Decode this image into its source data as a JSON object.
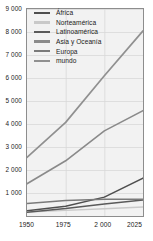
{
  "chart_data": {
    "type": "line",
    "title": "",
    "xlabel": "",
    "ylabel": "",
    "xlim": [
      1950,
      2025
    ],
    "ylim": [
      0,
      9000
    ],
    "grid": true,
    "legend_position": "top-left",
    "x": [
      1950,
      1975,
      2000,
      2025
    ],
    "y_ticks": [
      "1 000",
      "2 000",
      "3 000",
      "4 000",
      "5 000",
      "6 000",
      "7 000",
      "8 000",
      "9 000"
    ],
    "y_tick_values": [
      1000,
      2000,
      3000,
      4000,
      5000,
      6000,
      7000,
      8000,
      9000
    ],
    "x_ticks": [
      "1950",
      "1975",
      "2 000",
      "2025"
    ],
    "x_tick_values": [
      1950,
      1975,
      2000,
      2025
    ],
    "series": [
      {
        "name": "África",
        "color": "#4f4f4f",
        "width": 1.5,
        "values": [
          230,
          420,
          820,
          1650
        ]
      },
      {
        "name": "Norteamérica",
        "color": "#c9c9c9",
        "width": 1.4,
        "values": [
          172,
          243,
          316,
          390
        ]
      },
      {
        "name": "Latinoamérica",
        "color": "#5a5a5a",
        "width": 1.5,
        "values": [
          167,
          322,
          520,
          700
        ]
      },
      {
        "name": "Asia y Oceanía",
        "color": "#8a8a8a",
        "width": 1.6,
        "values": [
          1400,
          2400,
          3700,
          4580
        ]
      },
      {
        "name": "Europa",
        "color": "#7a7a7a",
        "width": 1.5,
        "values": [
          547,
          676,
          727,
          730
        ]
      },
      {
        "name": "mundo",
        "color": "#909090",
        "width": 1.7,
        "values": [
          2550,
          4070,
          6100,
          8050
        ]
      }
    ]
  },
  "legend": {
    "items": [
      {
        "label": "África",
        "color": "#4f4f4f"
      },
      {
        "label": "Norteamérica",
        "color": "#c9c9c9"
      },
      {
        "label": "Latinoamérica",
        "color": "#5a5a5a"
      },
      {
        "label": "Asia y Oceanía",
        "color": "#8a8a8a"
      },
      {
        "label": "Europa",
        "color": "#7a7a7a"
      },
      {
        "label": "mundo",
        "color": "#909090"
      }
    ]
  },
  "style": {
    "plot_background": "#f2f2f2",
    "grid_color": "#d8d8d8",
    "frame_color": "#8d8d8d",
    "text_color": "#1a1a1a"
  }
}
